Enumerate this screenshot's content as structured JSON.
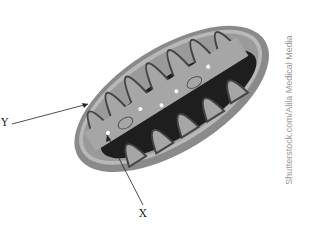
{
  "diagram": {
    "labels": {
      "y": "Y",
      "x": "X"
    },
    "credit": "Shutterstock.com/Alila Medical Media",
    "colors": {
      "outer": "#8a8a8a",
      "outer_rim": "#b8b8b8",
      "inner_space": "#9a9a9a",
      "matrix": "#222222",
      "membrane": "#444444"
    }
  }
}
